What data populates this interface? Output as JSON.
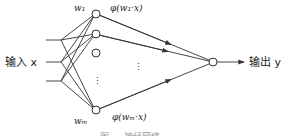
{
  "diagram": {
    "type": "single-hidden-layer neural network",
    "input_label": "输入 x",
    "output_label": "输出 y",
    "hidden_nodes": [
      {
        "weight_label": "w₁",
        "activation_label": "φ(w₁·x)"
      },
      {
        "weight_label": "",
        "activation_label": ""
      },
      {
        "weight_label": "",
        "activation_label": ""
      },
      {
        "weight_label": "wₘ",
        "activation_label": "φ(wₘ·x)"
      }
    ],
    "ellipsis": "⋮",
    "caption": "图 … 神经网络",
    "colors": {
      "stroke": "#333333",
      "text": "#222222",
      "background": "#ffffff"
    }
  }
}
